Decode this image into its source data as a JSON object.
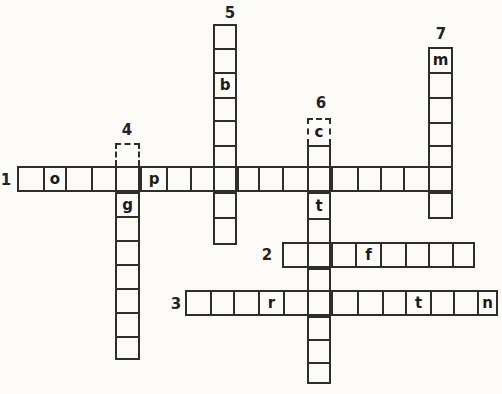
{
  "page": {
    "kind": "crossword-puzzle",
    "paper_color": "#fcfbf8",
    "ink_color": "#2e2d29",
    "width": 502,
    "height": 394
  },
  "puzzle": {
    "entries": [
      {
        "number": "1",
        "direction": "across",
        "y": 166,
        "size": 26,
        "bounds": [
          17,
          43,
          65,
          91,
          115,
          140,
          166,
          190,
          213,
          237,
          258,
          282,
          307,
          331,
          357,
          380,
          403,
          428,
          453
        ],
        "letters": {
          "1": "o",
          "5": "p"
        },
        "dashed": [],
        "label": {
          "x": 6,
          "y": 180
        }
      },
      {
        "number": "2",
        "direction": "across",
        "y": 242,
        "size": 26,
        "bounds": [
          282,
          307,
          331,
          355,
          380,
          405,
          428,
          452,
          475
        ],
        "letters": {
          "3": "f"
        },
        "dashed": [],
        "label": {
          "x": 267,
          "y": 255
        }
      },
      {
        "number": "3",
        "direction": "across",
        "y": 290,
        "size": 26,
        "bounds": [
          185,
          210,
          233,
          258,
          283,
          307,
          331,
          357,
          382,
          405,
          430,
          453,
          477,
          498
        ],
        "letters": {
          "3": "r",
          "9": "t",
          "12": "n"
        },
        "dashed": [],
        "label": {
          "x": 176,
          "y": 304
        }
      },
      {
        "number": "4",
        "direction": "down",
        "x": 115,
        "size": 25,
        "bounds": [
          143,
          166,
          192,
          216,
          240,
          264,
          288,
          312,
          336,
          360
        ],
        "letters": {
          "2": "g"
        },
        "dashed": [
          0
        ],
        "label": {
          "x": 127,
          "y": 130
        }
      },
      {
        "number": "5",
        "direction": "down",
        "x": 213,
        "size": 24,
        "bounds": [
          24,
          48,
          72,
          97,
          120,
          145,
          166,
          192,
          217,
          245
        ],
        "letters": {
          "2": "b"
        },
        "dashed": [],
        "label": {
          "x": 230,
          "y": 13
        }
      },
      {
        "number": "6",
        "direction": "down",
        "x": 307,
        "size": 24,
        "bounds": [
          118,
          145,
          166,
          192,
          218,
          242,
          268,
          290,
          316,
          339,
          362,
          384
        ],
        "letters": {
          "0": "c",
          "3": "t"
        },
        "dashed": [
          0
        ],
        "label": {
          "x": 321,
          "y": 103
        }
      },
      {
        "number": "7",
        "direction": "down",
        "x": 428,
        "size": 25,
        "bounds": [
          47,
          72,
          97,
          122,
          145,
          166,
          192,
          219
        ],
        "letters": {
          "0": "m"
        },
        "dashed": [],
        "label": {
          "x": 441,
          "y": 34
        }
      }
    ]
  }
}
